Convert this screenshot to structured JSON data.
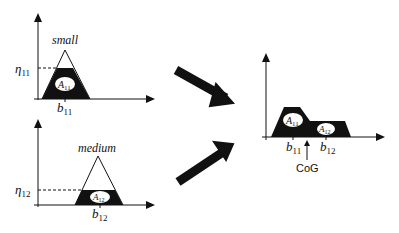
{
  "diagram": {
    "panels": [
      {
        "id": "small",
        "label": "small",
        "eta_label": "η",
        "eta_sub": "11",
        "area_label": "A",
        "area_sub": "11",
        "b_label": "b",
        "b_sub": "11"
      },
      {
        "id": "medium",
        "label": "medium",
        "eta_label": "η",
        "eta_sub": "12",
        "area_label": "A",
        "area_sub": "12",
        "b_label": "b",
        "b_sub": "12"
      }
    ],
    "result": {
      "area1_label": "A",
      "area1_sub": "11",
      "area2_label": "A",
      "area2_sub": "12",
      "b1_label": "b",
      "b1_sub": "11",
      "b2_label": "b",
      "b2_sub": "12",
      "cog_label": "CoG"
    },
    "colors": {
      "ink": "#111111",
      "background": "#ffffff"
    }
  }
}
